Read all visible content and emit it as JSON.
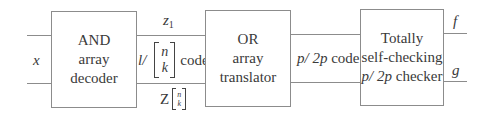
{
  "diagram": {
    "type": "block-diagram",
    "colors": {
      "line": "#8c8c8c",
      "text": "#3a3a3a"
    },
    "input": {
      "label": "x"
    },
    "blocks": [
      {
        "id": "and-decoder",
        "lines": [
          "AND",
          "array",
          "decoder"
        ]
      },
      {
        "id": "or-translator",
        "lines": [
          "OR",
          "array",
          "translator"
        ]
      },
      {
        "id": "tsc-checker",
        "lines": [
          "Totally",
          "self-checking",
          "p/ 2p checker"
        ]
      }
    ],
    "bus1": {
      "top_label_var": "z",
      "top_label_sub": "1",
      "middle_prefix": "l/",
      "binom_n": "n",
      "binom_k": "k",
      "middle_suffix": "code",
      "bottom_label_var": "Z",
      "bottom_binom_n": "n",
      "bottom_binom_k": "k"
    },
    "bus2": {
      "var1": "p/",
      "var2": "2p",
      "suffix": "code"
    },
    "checker_line3": {
      "var1": "p/",
      "var2": "2p",
      "suffix": "checker"
    },
    "outputs": [
      {
        "label": "f"
      },
      {
        "label": "g"
      }
    ]
  }
}
